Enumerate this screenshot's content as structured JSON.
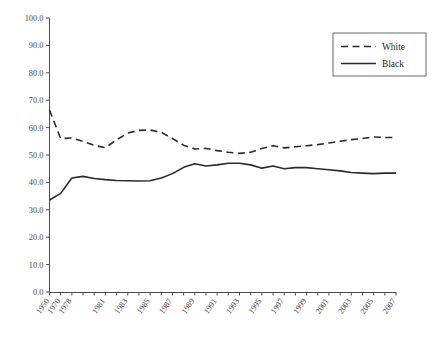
{
  "chart_data": {
    "type": "line",
    "title": "",
    "subtitle": "",
    "xlabel": "",
    "ylabel": "",
    "ylim": [
      0.0,
      100.0
    ],
    "yticks": [
      "0.0",
      "10.0",
      "20.0",
      "30.0",
      "40.0",
      "50.0",
      "60.0",
      "70.0",
      "80.0",
      "90.0",
      "100.0"
    ],
    "ytick_values": [
      0,
      10,
      20,
      30,
      40,
      50,
      60,
      70,
      80,
      90,
      100
    ],
    "grid": false,
    "legend_position": "top-right",
    "x": [
      "1950",
      "1970",
      "1978",
      "1979",
      "1980",
      "1981",
      "1982",
      "1983",
      "1984",
      "1985",
      "1986",
      "1987",
      "1988",
      "1989",
      "1990",
      "1991",
      "1992",
      "1993",
      "1994",
      "1995",
      "1996",
      "1997",
      "1998",
      "1999",
      "2000",
      "2001",
      "2002",
      "2003",
      "2004",
      "2005",
      "2006",
      "2007"
    ],
    "xtick_labels": [
      "1950",
      "1970",
      "1978",
      "1981",
      "1983",
      "1985",
      "1987",
      "1989",
      "1991",
      "1993",
      "1995",
      "1997",
      "1999",
      "2001",
      "2003",
      "2005",
      "2007"
    ],
    "series": [
      {
        "name": "White",
        "style": "dashed",
        "color": "#2b2b2b",
        "values": [
          66.4,
          56.0,
          56.2,
          55.0,
          53.5,
          52.7,
          55.5,
          58.0,
          59.0,
          59.1,
          58.3,
          56.0,
          53.6,
          52.2,
          52.4,
          51.6,
          51.0,
          50.6,
          51.0,
          52.4,
          53.4,
          52.6,
          53.0,
          53.4,
          53.8,
          54.4,
          55.0,
          55.6,
          56.0,
          56.6,
          56.4,
          56.4
        ]
      },
      {
        "name": "Black",
        "style": "solid",
        "color": "#2b2b2b",
        "values": [
          33.6,
          36.0,
          41.6,
          42.2,
          41.4,
          41.0,
          40.7,
          40.6,
          40.5,
          40.6,
          41.6,
          43.2,
          45.5,
          46.8,
          46.0,
          46.4,
          47.0,
          47.0,
          46.4,
          45.2,
          46.0,
          45.0,
          45.4,
          45.4,
          45.0,
          44.6,
          44.2,
          43.6,
          43.4,
          43.2,
          43.4,
          43.4
        ]
      }
    ],
    "legend": [
      {
        "label": "White",
        "style": "dashed"
      },
      {
        "label": "Black",
        "style": "solid"
      }
    ]
  }
}
